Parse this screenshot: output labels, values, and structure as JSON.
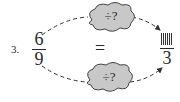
{
  "problem": {
    "number": "3.",
    "left_fraction": {
      "numerator": "6",
      "denominator": "9"
    },
    "equals": "=",
    "right_fraction": {
      "numerator_blank": true,
      "denominator": "3"
    },
    "top_cloud": {
      "label": "÷?"
    },
    "bottom_cloud": {
      "label": "÷?"
    }
  },
  "colors": {
    "cloud_fill": "#c8c8c8",
    "cloud_stroke": "#444444",
    "text": "#2a2a2a"
  }
}
